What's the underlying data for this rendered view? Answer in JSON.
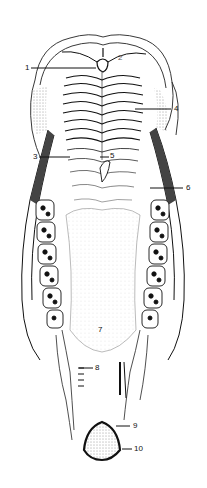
{
  "figure": {
    "background": "#ffffff",
    "ink": "#111111",
    "labels": [
      {
        "id": "1",
        "text": "1",
        "x": 25,
        "y": 64,
        "line": [
          31,
          68,
          96,
          68
        ]
      },
      {
        "id": "2",
        "text": "2",
        "x": 118,
        "y": 54,
        "line": null
      },
      {
        "id": "3",
        "text": "3",
        "x": 33,
        "y": 152,
        "line": [
          39,
          157,
          70,
          157
        ]
      },
      {
        "id": "4",
        "text": "4",
        "x": 175,
        "y": 105,
        "line": [
          135,
          109,
          171,
          109
        ]
      },
      {
        "id": "5",
        "text": "5",
        "x": 110,
        "y": 152,
        "line": [
          100,
          157,
          109,
          157
        ]
      },
      {
        "id": "6",
        "text": "6",
        "x": 186,
        "y": 184,
        "line": [
          150,
          188,
          183,
          188
        ]
      },
      {
        "id": "7",
        "text": "7",
        "x": 98,
        "y": 326,
        "line": null
      },
      {
        "id": "8",
        "text": "8",
        "x": 95,
        "y": 364,
        "line": [
          79,
          368,
          93,
          368
        ]
      },
      {
        "id": "9",
        "text": "9",
        "x": 133,
        "y": 423,
        "line": [
          116,
          426,
          130,
          426
        ]
      },
      {
        "id": "10",
        "text": "10",
        "x": 135,
        "y": 446,
        "line": [
          122,
          449,
          132,
          449
        ]
      }
    ]
  }
}
